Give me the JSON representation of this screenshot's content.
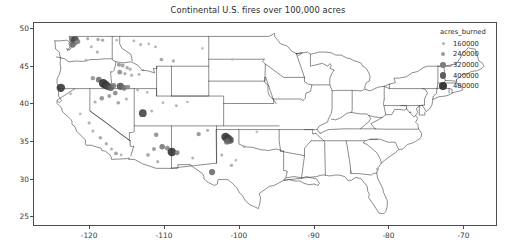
{
  "chart_data": {
    "type": "scatter",
    "title": "Continental U.S. fires over 100,000 acres",
    "xlabel": "",
    "ylabel": "",
    "xlim": [
      -127.5,
      -65.5
    ],
    "ylim": [
      23.7,
      50.8
    ],
    "xticks": [
      "-120",
      "-110",
      "-100",
      "-90",
      "-80",
      "-70"
    ],
    "xtick_values": [
      -120,
      -110,
      -100,
      -90,
      -80,
      -70
    ],
    "yticks": [
      "25",
      "30",
      "35",
      "40",
      "45",
      "50"
    ],
    "ytick_values": [
      25,
      30,
      35,
      40,
      45,
      50
    ],
    "grid": false,
    "legend": {
      "title": "acres_burned",
      "position": "upper right outside",
      "entries": [
        {
          "label": "160000",
          "value": 160000,
          "radius": 1.5,
          "color": "#b0b0b0"
        },
        {
          "label": "240000",
          "value": 240000,
          "radius": 2.1,
          "color": "#9a9a9a"
        },
        {
          "label": "320000",
          "value": 320000,
          "radius": 2.7,
          "color": "#7d7d7d"
        },
        {
          "label": "400000",
          "value": 400000,
          "radius": 3.4,
          "color": "#5c5c5c"
        },
        {
          "label": "480000",
          "value": 480000,
          "radius": 4.2,
          "color": "#3a3a3a"
        }
      ]
    },
    "size_encoding": "acres_burned",
    "series": [
      {
        "name": "fires",
        "points": [
          {
            "x": -122.4,
            "y": 48.6,
            "acres_burned": 300000
          },
          {
            "x": -122.0,
            "y": 48.5,
            "acres_burned": 430000
          },
          {
            "x": -121.6,
            "y": 48.3,
            "acres_burned": 250000
          },
          {
            "x": -121.9,
            "y": 48.1,
            "acres_burned": 210000
          },
          {
            "x": -122.3,
            "y": 47.9,
            "acres_burned": 330000
          },
          {
            "x": -120.3,
            "y": 48.7,
            "acres_burned": 150000
          },
          {
            "x": -118.9,
            "y": 48.6,
            "acres_burned": 170000
          },
          {
            "x": -118.3,
            "y": 48.5,
            "acres_burned": 160000
          },
          {
            "x": -119.8,
            "y": 47.6,
            "acres_burned": 140000
          },
          {
            "x": -119.0,
            "y": 46.9,
            "acres_burned": 150000
          },
          {
            "x": -120.5,
            "y": 45.8,
            "acres_burned": 130000
          },
          {
            "x": -116.4,
            "y": 48.5,
            "acres_burned": 120000
          },
          {
            "x": -114.1,
            "y": 48.4,
            "acres_burned": 130000
          },
          {
            "x": -113.2,
            "y": 47.9,
            "acres_burned": 140000
          },
          {
            "x": -112.1,
            "y": 48.0,
            "acres_burned": 125000
          },
          {
            "x": -111.2,
            "y": 47.6,
            "acres_burned": 135000
          },
          {
            "x": -110.4,
            "y": 45.9,
            "acres_burned": 180000
          },
          {
            "x": -108.8,
            "y": 45.7,
            "acres_burned": 160000
          },
          {
            "x": -116.1,
            "y": 45.2,
            "acres_burned": 210000
          },
          {
            "x": -115.6,
            "y": 45.1,
            "acres_burned": 190000
          },
          {
            "x": -115.0,
            "y": 44.8,
            "acres_burned": 170000
          },
          {
            "x": -114.6,
            "y": 44.6,
            "acres_burned": 150000
          },
          {
            "x": -116.0,
            "y": 44.2,
            "acres_burned": 240000
          },
          {
            "x": -115.3,
            "y": 44.0,
            "acres_burned": 160000
          },
          {
            "x": -114.4,
            "y": 43.8,
            "acres_burned": 145000
          },
          {
            "x": -113.4,
            "y": 43.9,
            "acres_burned": 135000
          },
          {
            "x": -119.6,
            "y": 43.4,
            "acres_burned": 220000
          },
          {
            "x": -118.8,
            "y": 43.2,
            "acres_burned": 310000
          },
          {
            "x": -118.2,
            "y": 42.7,
            "acres_burned": 480000
          },
          {
            "x": -117.9,
            "y": 42.5,
            "acres_burned": 460000
          },
          {
            "x": -117.6,
            "y": 42.3,
            "acres_burned": 420000
          },
          {
            "x": -117.2,
            "y": 42.1,
            "acres_burned": 350000
          },
          {
            "x": -116.8,
            "y": 42.4,
            "acres_burned": 280000
          },
          {
            "x": -115.9,
            "y": 42.3,
            "acres_burned": 390000
          },
          {
            "x": -115.4,
            "y": 42.1,
            "acres_burned": 300000
          },
          {
            "x": -114.9,
            "y": 42.2,
            "acres_burned": 240000
          },
          {
            "x": -116.6,
            "y": 41.4,
            "acres_burned": 250000
          },
          {
            "x": -117.4,
            "y": 41.0,
            "acres_burned": 200000
          },
          {
            "x": -118.4,
            "y": 40.7,
            "acres_burned": 230000
          },
          {
            "x": -119.3,
            "y": 40.2,
            "acres_burned": 150000
          },
          {
            "x": -116.2,
            "y": 40.1,
            "acres_burned": 180000
          },
          {
            "x": -115.1,
            "y": 40.6,
            "acres_burned": 140000
          },
          {
            "x": -113.6,
            "y": 41.8,
            "acres_burned": 135000
          },
          {
            "x": -112.3,
            "y": 41.5,
            "acres_burned": 120000
          },
          {
            "x": -123.9,
            "y": 42.1,
            "acres_burned": 470000
          },
          {
            "x": -122.6,
            "y": 41.3,
            "acres_burned": 130000
          },
          {
            "x": -121.3,
            "y": 38.6,
            "acres_burned": 120000
          },
          {
            "x": -120.1,
            "y": 37.4,
            "acres_burned": 150000
          },
          {
            "x": -119.6,
            "y": 36.3,
            "acres_burned": 140000
          },
          {
            "x": -118.6,
            "y": 35.4,
            "acres_burned": 175000
          },
          {
            "x": -117.8,
            "y": 34.6,
            "acres_burned": 160000
          },
          {
            "x": -117.1,
            "y": 33.9,
            "acres_burned": 150000
          },
          {
            "x": -116.5,
            "y": 33.3,
            "acres_burned": 190000
          },
          {
            "x": -115.8,
            "y": 33.1,
            "acres_burned": 130000
          },
          {
            "x": -112.9,
            "y": 38.7,
            "acres_burned": 430000
          },
          {
            "x": -111.7,
            "y": 39.0,
            "acres_burned": 140000
          },
          {
            "x": -110.2,
            "y": 40.1,
            "acres_burned": 125000
          },
          {
            "x": -108.4,
            "y": 39.7,
            "acres_burned": 135000
          },
          {
            "x": -106.9,
            "y": 40.2,
            "acres_burned": 120000
          },
          {
            "x": -111.1,
            "y": 35.8,
            "acres_burned": 230000
          },
          {
            "x": -110.3,
            "y": 34.2,
            "acres_burned": 290000
          },
          {
            "x": -109.6,
            "y": 34.0,
            "acres_burned": 250000
          },
          {
            "x": -109.0,
            "y": 33.5,
            "acres_burned": 480000
          },
          {
            "x": -108.3,
            "y": 33.4,
            "acres_burned": 260000
          },
          {
            "x": -111.4,
            "y": 33.9,
            "acres_burned": 200000
          },
          {
            "x": -112.2,
            "y": 33.1,
            "acres_burned": 180000
          },
          {
            "x": -110.9,
            "y": 32.2,
            "acres_burned": 150000
          },
          {
            "x": -106.2,
            "y": 32.7,
            "acres_burned": 140000
          },
          {
            "x": -105.4,
            "y": 35.9,
            "acres_burned": 220000
          },
          {
            "x": -104.2,
            "y": 36.4,
            "acres_burned": 150000
          },
          {
            "x": -101.8,
            "y": 35.5,
            "acres_burned": 470000
          },
          {
            "x": -101.5,
            "y": 35.3,
            "acres_burned": 450000
          },
          {
            "x": -101.2,
            "y": 35.1,
            "acres_burned": 410000
          },
          {
            "x": -101.6,
            "y": 34.9,
            "acres_burned": 330000
          },
          {
            "x": -102.3,
            "y": 33.1,
            "acres_burned": 145000
          },
          {
            "x": -101.0,
            "y": 31.7,
            "acres_burned": 160000
          },
          {
            "x": -103.6,
            "y": 30.8,
            "acres_burned": 330000
          },
          {
            "x": -100.4,
            "y": 32.4,
            "acres_burned": 120000
          },
          {
            "x": -99.3,
            "y": 34.2,
            "acres_burned": 130000
          },
          {
            "x": -97.6,
            "y": 36.2,
            "acres_burned": 115000
          },
          {
            "x": -104.9,
            "y": 47.4,
            "acres_burned": 115000
          },
          {
            "x": -100.9,
            "y": 45.9,
            "acres_burned": 110000
          },
          {
            "x": -81.4,
            "y": 31.2,
            "acres_burned": 140000
          }
        ]
      }
    ]
  }
}
